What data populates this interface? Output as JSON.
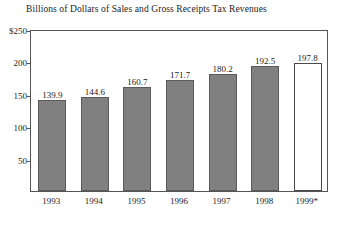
{
  "chart_data": {
    "type": "bar",
    "title": "Billions of Dollars of Sales and Gross Receipts Tax Revenues",
    "xlabel": "",
    "ylabel": "",
    "categories": [
      "1993",
      "1994",
      "1995",
      "1996",
      "1997",
      "1998",
      "1999*"
    ],
    "values": [
      139.9,
      144.6,
      160.7,
      171.7,
      180.2,
      192.5,
      197.8
    ],
    "data_labels": [
      "139.9",
      "144.6",
      "160.7",
      "171.7",
      "180.2",
      "192.5",
      "197.8"
    ],
    "ylim": [
      0,
      250
    ],
    "ytick_labels": [
      "$250",
      "200",
      "150",
      "100",
      "50"
    ],
    "ytick_values": [
      250,
      200,
      150,
      100,
      50
    ],
    "grid": false,
    "legend": "none",
    "bar_styles": [
      "filled",
      "filled",
      "filled",
      "filled",
      "filled",
      "filled",
      "open"
    ],
    "colors": {
      "bar_fill": "#808080",
      "bar_edge": "#5b5b5b",
      "open_bar_fill": "#ffffff",
      "open_bar_edge": "#4a4a4a",
      "frame": "#555555",
      "text": "#1c1c1c",
      "background": "#ffffff"
    }
  }
}
